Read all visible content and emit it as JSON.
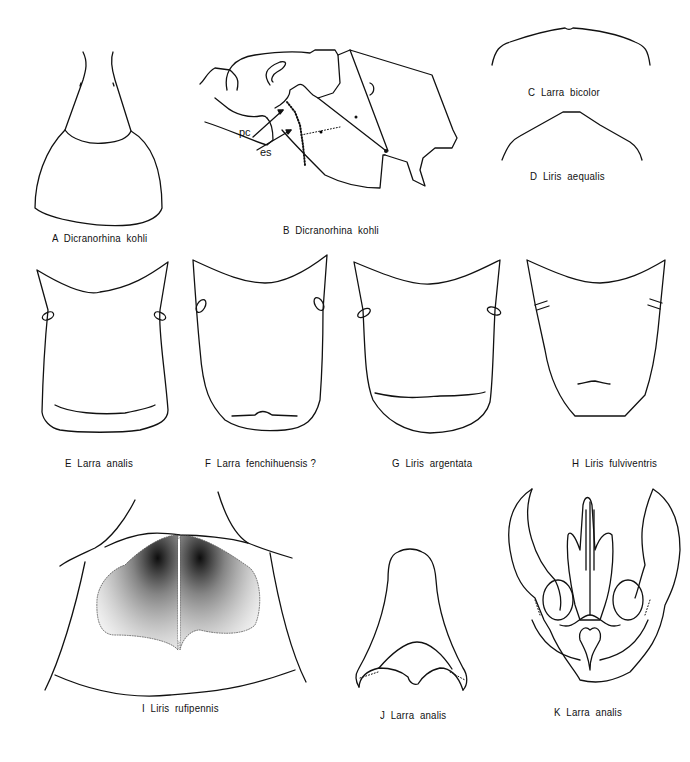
{
  "plate": {
    "background": "#ffffff",
    "ink": "#111111",
    "figures": [
      {
        "id": "A",
        "letter": "A",
        "taxon": "Dicranorhina kohli",
        "caption": "A  Dicranorhina  kohli"
      },
      {
        "id": "B",
        "letter": "B",
        "taxon": "Dicranorhina kohli",
        "caption": "B  Dicranorhina  kohli",
        "annotations": [
          {
            "label": "pc"
          },
          {
            "label": "es"
          }
        ]
      },
      {
        "id": "C",
        "letter": "C",
        "taxon": "Larra bicolor",
        "caption": "C  Larra  bicolor"
      },
      {
        "id": "D",
        "letter": "D",
        "taxon": "Liris aequalis",
        "caption": "D  Liris  aequalis"
      },
      {
        "id": "E",
        "letter": "E",
        "taxon": "Larra analis",
        "caption": "E  Larra  analis"
      },
      {
        "id": "F",
        "letter": "F",
        "taxon": "Larra fenchihuensis ?",
        "caption": "F  Larra  fenchihuensis ?"
      },
      {
        "id": "G",
        "letter": "G",
        "taxon": "Liris argentata",
        "caption": "G  Liris  argentata"
      },
      {
        "id": "H",
        "letter": "H",
        "taxon": "Liris fulviventris",
        "caption": "H  Liris  fulviventris"
      },
      {
        "id": "I",
        "letter": "I",
        "taxon": "Liris rufipennis",
        "caption": "I  Liris  rufipennis"
      },
      {
        "id": "J",
        "letter": "J",
        "taxon": "Larra analis",
        "caption": "J  Larra  analis"
      },
      {
        "id": "K",
        "letter": "K",
        "taxon": "Larra analis",
        "caption": "K  Larra  analis"
      }
    ]
  }
}
